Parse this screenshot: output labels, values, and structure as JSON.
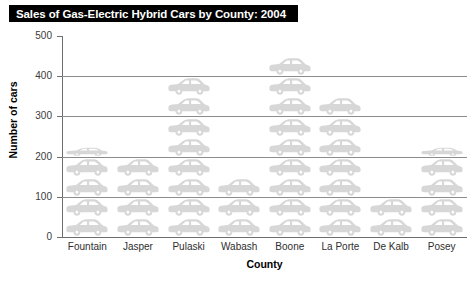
{
  "title": {
    "text": "Sales of Gas-Electric Hybrid Cars by County: 2004"
  },
  "chart_data": {
    "type": "bar",
    "subtype": "pictograph",
    "title": "Sales of Gas-Electric Hybrid Cars by County: 2004",
    "xlabel": "County",
    "ylabel": "Number of cars",
    "ylim": [
      0,
      500
    ],
    "ytick_labels": [
      "0",
      "100",
      "200",
      "300",
      "400",
      "500"
    ],
    "ytick_values": [
      0,
      100,
      200,
      300,
      400,
      500
    ],
    "grid": "horizontal",
    "legend": "none",
    "icon_unit": 50,
    "icon_name": "car-icon",
    "categories": [
      "Fountain",
      "Jasper",
      "Pulaski",
      "Wabash",
      "Boone",
      "La Porte",
      "De Kalb",
      "Posey"
    ],
    "values": [
      225,
      200,
      400,
      150,
      450,
      350,
      100,
      225
    ],
    "icon_counts": [
      4.5,
      4,
      8,
      3,
      9,
      7,
      2,
      4.5
    ],
    "series": [
      {
        "name": "Number of cars",
        "values": [
          225,
          200,
          400,
          150,
          450,
          350,
          100,
          225
        ]
      }
    ],
    "colors": {
      "icon_fill": "#d7d7d7",
      "gridline": "#8c8c8c",
      "axis": "#6e6e6e",
      "title_bg": "#000000",
      "title_fg": "#ffffff",
      "background": "#ffffff"
    }
  }
}
